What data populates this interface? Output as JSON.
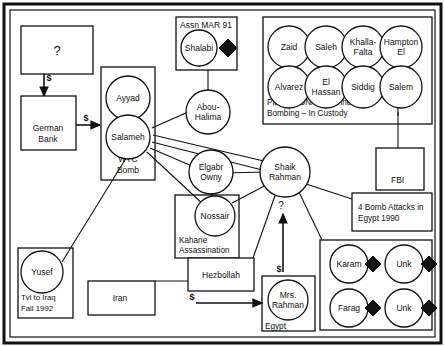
{
  "diagram": {
    "type": "link-analysis-network",
    "border_color": "#111111",
    "background_color": "#ffffff"
  },
  "nodes": {
    "unknown_source": "?",
    "german_bank": "German Bank",
    "ayyad": "Ayyad",
    "salameh": "Salameh",
    "wtc_bomb_label": "WTC Bomb",
    "shalabi": "Shalabi",
    "assn_mar_91": "Assn MAR 91",
    "abou_halima": "Abou-Halima",
    "elgabr_owny": "Elgabr Owny",
    "nossair": "Nossair",
    "kahane_label": "Kahane Assassination",
    "shaik_rahman": "Shaik Rahman",
    "fbi": "FBI",
    "bomb_attacks": "4 Bomb Attacks in Egypt 1990",
    "yusef": "Yusef",
    "yusef_note": "Tvl to Iraq Fall 1992",
    "iran": "Iran",
    "hezbollah": "Hezbollah",
    "mrs_rahman": "Mrs. Rahman",
    "egypt_label": "Egypt"
  },
  "custody_group": {
    "caption_line1": "Planned UN/FBI/Tunnel",
    "caption_line2": "Bombing – In Custody",
    "members": [
      "Zaid",
      "Saleh",
      "Khalla-Falta",
      "Hampton El",
      "Alvarez",
      "El Hassan",
      "Siddig",
      "Salem"
    ]
  },
  "diamond_group": {
    "members": [
      "Karam",
      "Unk",
      "Farag",
      "Unk"
    ],
    "marker": "black-diamond"
  },
  "flows": {
    "money_symbol": "$",
    "unknown_symbol": "?",
    "unknown_to_bank": "$",
    "bank_to_wtc": "$",
    "iran_to_mrs_rahman": "$",
    "mrs_rahman_to_shaik_money": "$",
    "mrs_rahman_to_shaik_query": "?"
  }
}
